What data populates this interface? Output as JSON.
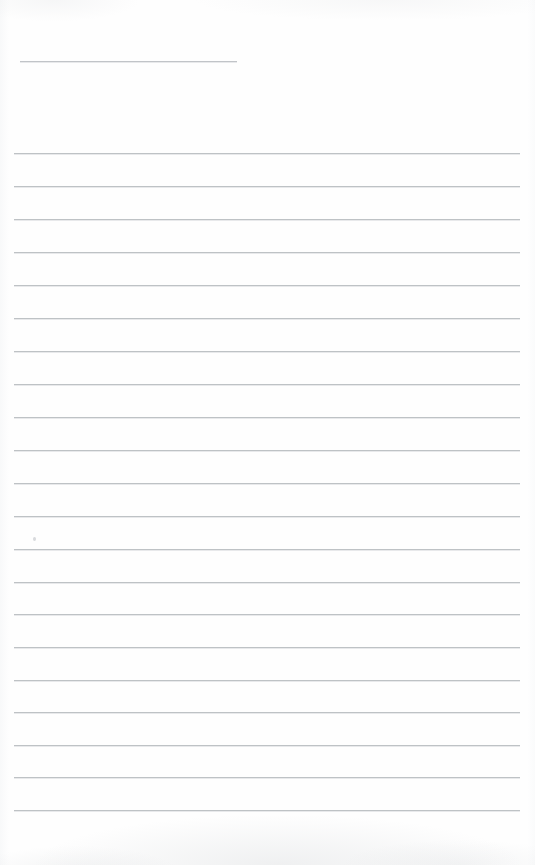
{
  "document": {
    "kind": "lined-notebook-page",
    "title": "Blank lined notebook page",
    "page_width": 535,
    "page_height": 865,
    "background_color": "#fefefe",
    "rule_color": "#b9bdc1",
    "speck_color": "#b2b6bb",
    "content_text": "",
    "notes": "Scanned blank ruled paper. No printed or handwritten text is present."
  },
  "layout": {
    "left_margin": 14,
    "right_edge": 520,
    "line_spacing": 32.8,
    "full_rule_count": 21,
    "short_rule_count": 1
  },
  "rules": [
    {
      "id": "rule-header",
      "type": "short",
      "y": 61,
      "x1": 20,
      "x2": 237
    },
    {
      "id": "rule-1",
      "type": "full",
      "y": 153,
      "x1": 14,
      "x2": 520
    },
    {
      "id": "rule-2",
      "type": "full",
      "y": 186,
      "x1": 14,
      "x2": 520
    },
    {
      "id": "rule-3",
      "type": "full",
      "y": 219,
      "x1": 14,
      "x2": 520
    },
    {
      "id": "rule-4",
      "type": "full",
      "y": 252,
      "x1": 14,
      "x2": 520
    },
    {
      "id": "rule-5",
      "type": "full",
      "y": 285,
      "x1": 14,
      "x2": 520
    },
    {
      "id": "rule-6",
      "type": "full",
      "y": 318,
      "x1": 14,
      "x2": 520
    },
    {
      "id": "rule-7",
      "type": "full",
      "y": 351,
      "x1": 14,
      "x2": 520
    },
    {
      "id": "rule-8",
      "type": "full",
      "y": 384,
      "x1": 14,
      "x2": 520
    },
    {
      "id": "rule-9",
      "type": "full",
      "y": 417,
      "x1": 14,
      "x2": 520
    },
    {
      "id": "rule-10",
      "type": "full",
      "y": 450,
      "x1": 14,
      "x2": 520
    },
    {
      "id": "rule-11",
      "type": "full",
      "y": 483,
      "x1": 14,
      "x2": 520
    },
    {
      "id": "rule-12",
      "type": "full",
      "y": 516,
      "x1": 14,
      "x2": 520
    },
    {
      "id": "rule-13",
      "type": "full",
      "y": 549,
      "x1": 14,
      "x2": 520
    },
    {
      "id": "rule-14",
      "type": "full",
      "y": 582,
      "x1": 14,
      "x2": 520
    },
    {
      "id": "rule-15",
      "type": "full",
      "y": 614,
      "x1": 14,
      "x2": 520
    },
    {
      "id": "rule-16",
      "type": "full",
      "y": 647,
      "x1": 14,
      "x2": 520
    },
    {
      "id": "rule-17",
      "type": "full",
      "y": 680,
      "x1": 14,
      "x2": 520
    },
    {
      "id": "rule-18",
      "type": "full",
      "y": 712,
      "x1": 14,
      "x2": 520
    },
    {
      "id": "rule-19",
      "type": "full",
      "y": 745,
      "x1": 14,
      "x2": 520
    },
    {
      "id": "rule-20",
      "type": "full",
      "y": 777,
      "x1": 14,
      "x2": 520
    },
    {
      "id": "rule-21",
      "type": "full",
      "y": 810,
      "x1": 14,
      "x2": 520
    }
  ],
  "marks": [
    {
      "id": "speck-1",
      "x": 33,
      "y": 537
    }
  ]
}
